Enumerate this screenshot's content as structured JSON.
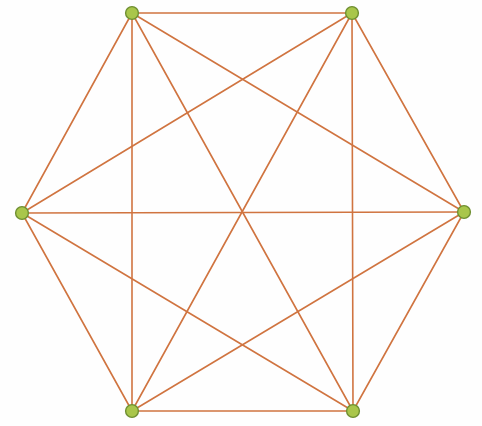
{
  "figure": {
    "type": "graph-diagram",
    "width": 482,
    "height": 426,
    "background_color": "#fefefe"
  },
  "style": {
    "edge_color": "#d07440",
    "edge_width": 1.6,
    "vertex_fill": "#a9c64a",
    "vertex_stroke": "#6f8f32",
    "vertex_stroke_width": 1.4,
    "vertex_radius": 6.4
  },
  "chart_data": {
    "type": "scatter",
    "xlabel": "",
    "ylabel": "",
    "xlim": [
      0,
      482
    ],
    "ylim": [
      0,
      426
    ],
    "grid": false,
    "legend": "none",
    "graph_kind": "complete-graph",
    "vertex_count": 6,
    "edge_count": 15,
    "nodes": [
      {
        "id": "v1",
        "label": "top-left",
        "x": 132,
        "y": 13
      },
      {
        "id": "v2",
        "label": "top-right",
        "x": 352,
        "y": 13
      },
      {
        "id": "v3",
        "label": "right",
        "x": 464,
        "y": 212
      },
      {
        "id": "v4",
        "label": "bottom-right",
        "x": 353,
        "y": 411
      },
      {
        "id": "v5",
        "label": "bottom-left",
        "x": 132,
        "y": 411
      },
      {
        "id": "v6",
        "label": "left",
        "x": 22,
        "y": 213
      }
    ],
    "edges": [
      {
        "from": "v1",
        "to": "v2",
        "kind": "side"
      },
      {
        "from": "v2",
        "to": "v3",
        "kind": "side"
      },
      {
        "from": "v3",
        "to": "v4",
        "kind": "side"
      },
      {
        "from": "v4",
        "to": "v5",
        "kind": "side"
      },
      {
        "from": "v5",
        "to": "v6",
        "kind": "side"
      },
      {
        "from": "v6",
        "to": "v1",
        "kind": "side"
      },
      {
        "from": "v1",
        "to": "v3",
        "kind": "short-diagonal"
      },
      {
        "from": "v1",
        "to": "v5",
        "kind": "short-diagonal"
      },
      {
        "from": "v2",
        "to": "v4",
        "kind": "short-diagonal"
      },
      {
        "from": "v2",
        "to": "v6",
        "kind": "short-diagonal"
      },
      {
        "from": "v3",
        "to": "v5",
        "kind": "short-diagonal"
      },
      {
        "from": "v4",
        "to": "v6",
        "kind": "short-diagonal"
      },
      {
        "from": "v1",
        "to": "v4",
        "kind": "long-diagonal"
      },
      {
        "from": "v2",
        "to": "v5",
        "kind": "long-diagonal"
      },
      {
        "from": "v3",
        "to": "v6",
        "kind": "long-diagonal"
      }
    ]
  }
}
